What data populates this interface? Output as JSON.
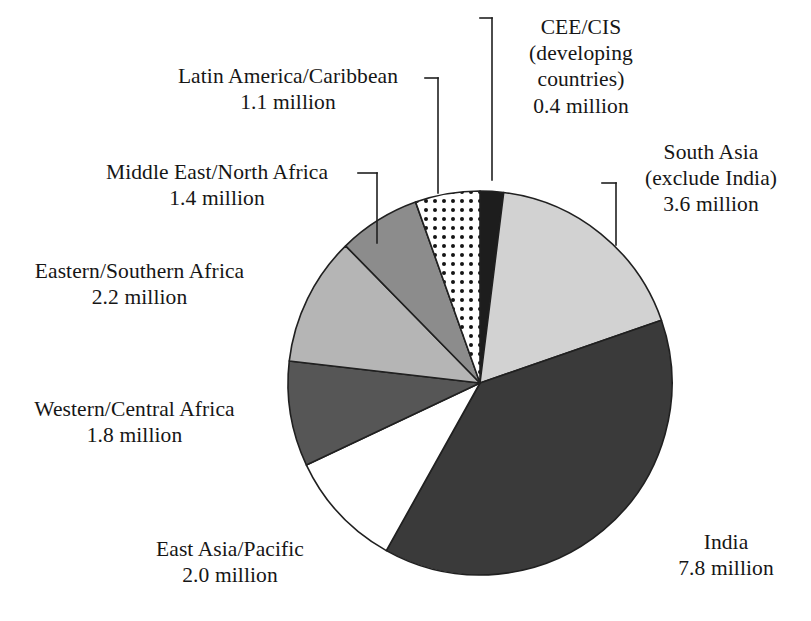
{
  "chart_data": {
    "type": "pie",
    "title": "",
    "subtitle": "",
    "xlabel": "",
    "ylabel": "",
    "units": "million",
    "total": 20.3,
    "legend_position": "none",
    "grid": false,
    "start_angle_deg": 0,
    "direction": "clockwise",
    "categories": [
      "CEE/CIS (developing countries)",
      "South Asia (exclude India)",
      "India",
      "East Asia/Pacific",
      "Western/Central Africa",
      "Eastern/Southern Africa",
      "Middle East/North Africa",
      "Latin America/Caribbean"
    ],
    "values": [
      0.4,
      3.6,
      7.8,
      2.0,
      1.8,
      2.2,
      1.4,
      1.1
    ],
    "slices": [
      {
        "id": "cee-cis",
        "name": "CEE/CIS (developing countries)",
        "value": 0.4,
        "value_label": "0.4 million",
        "percent": 2.0,
        "start_deg": 0.0,
        "end_deg": 7.1,
        "fill": "#1d1d1d",
        "pattern": "solid"
      },
      {
        "id": "south-asia",
        "name": "South Asia (exclude India)",
        "value": 3.6,
        "value_label": "3.6 million",
        "percent": 17.7,
        "start_deg": 7.1,
        "end_deg": 70.9,
        "fill": "#d2d2d2",
        "pattern": "solid"
      },
      {
        "id": "india",
        "name": "India",
        "value": 7.8,
        "value_label": "7.8 million",
        "percent": 38.4,
        "start_deg": 70.9,
        "end_deg": 209.2,
        "fill": "#3a3a3a",
        "pattern": "solid"
      },
      {
        "id": "east-asia-pacific",
        "name": "East Asia/Pacific",
        "value": 2.0,
        "value_label": "2.0 million",
        "percent": 9.9,
        "start_deg": 209.2,
        "end_deg": 244.7,
        "fill": "#ffffff",
        "pattern": "solid"
      },
      {
        "id": "western-central-africa",
        "name": "Western/Central Africa",
        "value": 1.8,
        "value_label": "1.8 million",
        "percent": 8.9,
        "start_deg": 244.7,
        "end_deg": 276.6,
        "fill": "#565656",
        "pattern": "solid"
      },
      {
        "id": "eastern-southern-africa",
        "name": "Eastern/Southern Africa",
        "value": 2.2,
        "value_label": "2.2 million",
        "percent": 10.8,
        "start_deg": 276.6,
        "end_deg": 315.6,
        "fill": "#b5b5b5",
        "pattern": "solid"
      },
      {
        "id": "middle-east-north-africa",
        "name": "Middle East/North Africa",
        "value": 1.4,
        "value_label": "1.4 million",
        "percent": 6.9,
        "start_deg": 315.6,
        "end_deg": 340.4,
        "fill": "#8c8c8c",
        "pattern": "solid"
      },
      {
        "id": "latin-america-caribbean",
        "name": "Latin America/Caribbean",
        "value": 1.1,
        "value_label": "1.1 million",
        "percent": 5.4,
        "start_deg": 340.4,
        "end_deg": 360.0,
        "fill": "#ffffff",
        "pattern": "dots"
      }
    ]
  },
  "labels": {
    "cee_cis": {
      "line1": "CEE/CIS",
      "line2": "(developing",
      "line3": "countries)",
      "line4": "0.4 million"
    },
    "south_asia": {
      "line1": "South Asia",
      "line2": "(exclude India)",
      "line3": "3.6 million"
    },
    "india": {
      "line1": "India",
      "line2": "7.8 million"
    },
    "east_asia_pacific": {
      "line1": "East Asia/Pacific",
      "line2": "2.0 million"
    },
    "western_central_africa": {
      "line1": "Western/Central Africa",
      "line2": "1.8 million"
    },
    "eastern_southern_africa": {
      "line1": "Eastern/Southern Africa",
      "line2": "2.2 million"
    },
    "middle_east_north_africa": {
      "line1": "Middle East/North Africa",
      "line2": "1.4 million"
    },
    "latin_america_caribbean": {
      "line1": "Latin America/Caribbean",
      "line2": "1.1 million"
    }
  },
  "geometry": {
    "center_x": 480,
    "center_y": 383,
    "radius": 192
  },
  "colors": {
    "background": "#ffffff",
    "text": "#161616",
    "outline": "#202020",
    "leader_line": "#202020"
  }
}
